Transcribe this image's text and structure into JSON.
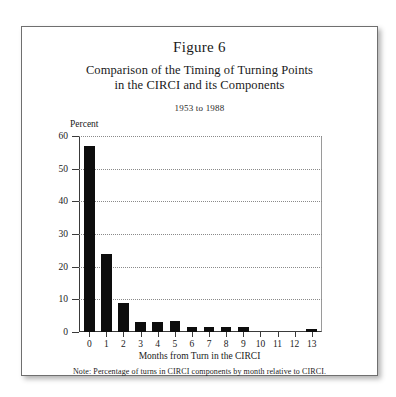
{
  "figure": {
    "title": "Figure 6",
    "subtitle_line1": "Comparison of the Timing of Turning Points",
    "subtitle_line2": "in the CIRCI and its Components",
    "date_range": "1953 to 1988",
    "note": "Note: Percentage of turns in CIRCI components by month relative to CIRCI."
  },
  "chart_data": {
    "type": "bar",
    "title": "Figure 6",
    "subtitle": "Comparison of the Timing of Turning Points in the CIRCI and its Components",
    "date_range": "1953 to 1988",
    "xlabel": "Months from Turn in the CIRCI",
    "ylabel": "Percent",
    "categories": [
      "0",
      "1",
      "2",
      "3",
      "4",
      "5",
      "6",
      "7",
      "8",
      "9",
      "10",
      "11",
      "12",
      "13"
    ],
    "values": [
      57,
      24,
      9,
      3,
      3,
      3.5,
      1.5,
      1.5,
      1.5,
      1.5,
      0,
      0,
      0,
      1
    ],
    "ylim": [
      0,
      60
    ],
    "yticks": [
      0,
      10,
      20,
      30,
      40,
      50,
      60
    ],
    "ytick_labels": [
      "0",
      "10",
      "20",
      "30",
      "40",
      "50",
      "60"
    ],
    "xlim": [
      -0.6,
      13.6
    ],
    "grid": "horizontal-dotted",
    "legend": "none",
    "bar_color": "#0d0d0d",
    "annotation": "Note: Percentage of turns in CIRCI components by month relative to CIRCI."
  }
}
